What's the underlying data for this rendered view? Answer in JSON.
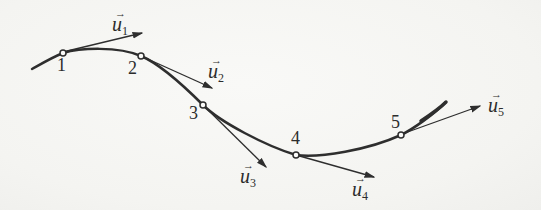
{
  "colors": {
    "background": "#f5f5f2",
    "ink": "#2e2e2e"
  },
  "diagram": {
    "type": "curve-with-direction-vectors",
    "points": [
      {
        "label": "1"
      },
      {
        "label": "2"
      },
      {
        "label": "3"
      },
      {
        "label": "4"
      },
      {
        "label": "5"
      }
    ],
    "vectors": [
      {
        "hat": "→",
        "base": "u",
        "subscript": "1"
      },
      {
        "hat": "→",
        "base": "u",
        "subscript": "2"
      },
      {
        "hat": "→",
        "base": "u",
        "subscript": "3"
      },
      {
        "hat": "→",
        "base": "u",
        "subscript": "4"
      },
      {
        "hat": "→",
        "base": "u",
        "subscript": "5"
      }
    ]
  }
}
